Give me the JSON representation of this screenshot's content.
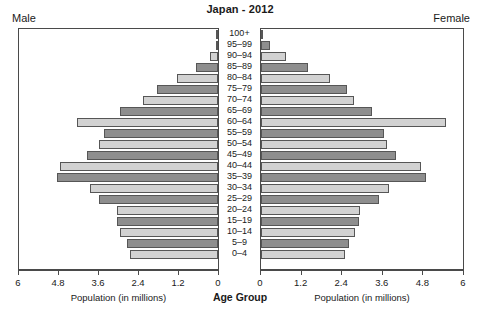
{
  "chart_data": {
    "type": "bar",
    "subtype": "population-pyramid",
    "title": "Japan - 2012",
    "left_panel_label": "Male",
    "right_panel_label": "Female",
    "categories": [
      "100+",
      "95–99",
      "90–94",
      "85–89",
      "80–84",
      "75–79",
      "70–74",
      "65–69",
      "60–64",
      "55–59",
      "50–54",
      "45–49",
      "40–44",
      "35–39",
      "30–34",
      "25–29",
      "20–24",
      "15–19",
      "10–14",
      "5–9",
      "0–4"
    ],
    "xlabel": "Population (in millions)",
    "center_axis_label": "Age Group",
    "ylabel": "",
    "xlim": [
      0,
      6
    ],
    "xticks": [
      0,
      1.2,
      2.4,
      3.6,
      4.8,
      6
    ],
    "xtick_labels": [
      "0",
      "1.2",
      "2.4",
      "3.6",
      "4.8",
      "6"
    ],
    "grid": false,
    "legend": "none",
    "bar_colors": {
      "dark": "#8e8e8e",
      "light": "#d2d2d2",
      "edge": "#565656"
    },
    "series": [
      {
        "name": "Male",
        "direction": "left",
        "values": [
          0.01,
          0.07,
          0.24,
          0.65,
          1.25,
          1.85,
          2.25,
          2.95,
          4.25,
          3.45,
          3.6,
          3.95,
          4.75,
          4.85,
          3.85,
          3.6,
          3.05,
          3.05,
          2.95,
          2.75,
          2.65
        ]
      },
      {
        "name": "Female",
        "direction": "right",
        "values": [
          0.06,
          0.27,
          0.75,
          1.4,
          2.05,
          2.55,
          2.75,
          3.3,
          5.5,
          3.65,
          3.75,
          4.0,
          4.75,
          4.9,
          3.8,
          3.5,
          2.95,
          2.9,
          2.8,
          2.6,
          2.5
        ]
      }
    ]
  }
}
